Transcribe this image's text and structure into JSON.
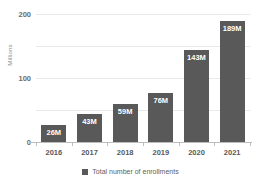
{
  "chart_data": {
    "type": "bar",
    "title": "",
    "xlabel": "",
    "ylabel": "Millions",
    "categories": [
      "2016",
      "2017",
      "2018",
      "2019",
      "2020",
      "2021"
    ],
    "values": [
      26,
      43,
      59,
      76,
      143,
      189
    ],
    "value_labels": [
      "26M",
      "43M",
      "59M",
      "76M",
      "143M",
      "189M"
    ],
    "series": [
      {
        "name": "Total number of enrollments",
        "values": [
          26,
          43,
          59,
          76,
          143,
          189
        ],
        "color": "#595959"
      }
    ],
    "ylim": [
      0,
      200
    ],
    "yticks": [
      0,
      50,
      100,
      150,
      200
    ],
    "ytick_labels": [
      "0",
      "",
      "100",
      "",
      "200"
    ],
    "grid": true,
    "legend_position": "bottom"
  },
  "legend": {
    "entries": [
      {
        "label": "Total number of enrollments",
        "color": "#595959"
      }
    ]
  },
  "colors": {
    "bar": "#595959",
    "grid": "#e9e9e9",
    "axis": "#bdbdbd",
    "tick_text": "#6d6d6d",
    "background": "#ffffff"
  }
}
